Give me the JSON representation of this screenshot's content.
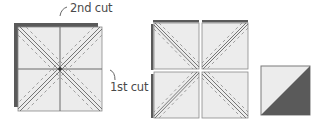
{
  "labels": {
    "second_cut": "2nd cut",
    "first_cut": "1st cut"
  },
  "colors": {
    "fabric_light": "#ececec",
    "fabric_dark": "#5a5a5a",
    "outline": "#7a7a7a",
    "cut_line": "#6a6a6a",
    "seam_line": "#8a8a8a",
    "text": "#4a4a4a"
  },
  "steps": [
    {
      "id": "stacked-squares",
      "description": "Two squares stacked, sewn 1/4in on both sides of both diagonals, then cut horizontally and vertically"
    },
    {
      "id": "four-units",
      "description": "Four units after cutting, then cut along diagonals"
    },
    {
      "id": "half-square-triangle",
      "description": "Resulting half-square triangle unit"
    }
  ]
}
